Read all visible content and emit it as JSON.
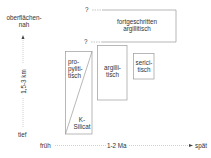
{
  "y_axis": {
    "top_label_line1": "oberflächen-",
    "top_label_line2": "nah",
    "middle_label": "1,5-3 km",
    "bottom_label": "tief"
  },
  "x_axis": {
    "left_label": "früh",
    "middle_label": "1-2 Ma",
    "right_label": "spät"
  },
  "uncertainty_marks": [
    "?",
    "?"
  ],
  "zones": [
    {
      "id": "fortgeschritten-argillitisch",
      "line1": "fortgeschritten",
      "line2": "argillitisch"
    },
    {
      "id": "propylitisch",
      "line1": "pro-",
      "line2": "pyliti-",
      "line3": "tisch"
    },
    {
      "id": "k-silicat",
      "line1": "K-",
      "line2": "Silicat"
    },
    {
      "id": "argillitisch",
      "line1": "argilli-",
      "line2": "tisch"
    },
    {
      "id": "sericitisch",
      "line1": "serici-",
      "line2": "tisch"
    }
  ],
  "colors": {
    "line": "#9a9a9a",
    "text": "#333333",
    "background": "#ffffff"
  }
}
